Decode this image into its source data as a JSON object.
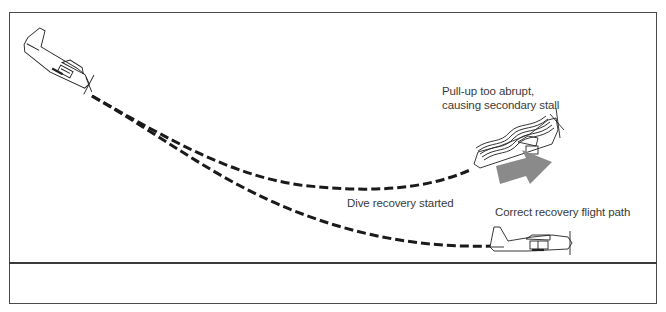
{
  "diagram": {
    "type": "flight-path-illustration",
    "labels": {
      "secondary_stall_line1": "Pull-up too abrupt,",
      "secondary_stall_line2": "causing secondary stall",
      "dive_recovery": "Dive recovery started",
      "correct_recovery": "Correct recovery flight path"
    },
    "elements": [
      {
        "id": "plane-diving",
        "description": "Airplane in nose-down dive, upper left"
      },
      {
        "id": "path-abrupt",
        "description": "Dashed flight path curving up abruptly into stall"
      },
      {
        "id": "path-correct",
        "description": "Dashed flight path with gradual recovery to level flight"
      },
      {
        "id": "plane-stalled",
        "description": "Airplane in nose-high secondary stall with airflow lines"
      },
      {
        "id": "sink-arrow",
        "description": "Gray arrow pointing down-right indicating sink"
      },
      {
        "id": "plane-level",
        "description": "Airplane in level flight after correct recovery"
      },
      {
        "id": "ground-line",
        "description": "Horizontal ground line"
      }
    ],
    "colors": {
      "frame": "#4a4a4a",
      "ink": "#1a1a1a",
      "arrow": "#8a8a8a",
      "text": "#3a3a3a",
      "background": "#ffffff"
    }
  }
}
